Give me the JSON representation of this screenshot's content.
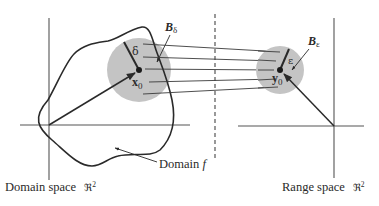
{
  "figure": {
    "colors": {
      "ink": "#2a2a2a",
      "ball_fill": "#c4c4c4",
      "axis": "#555555"
    },
    "domain_panel": {
      "ball_label_main": "B",
      "ball_label_sub": "δ",
      "radius_label": "δ",
      "point_label_main": "x",
      "point_label_sub": "0",
      "region_label_main": "Domain ",
      "region_label_italic": "f",
      "space_label": "Domain space",
      "space_symbol_main": "ℜ",
      "space_symbol_sup": "2"
    },
    "range_panel": {
      "ball_label_main": "B",
      "ball_label_sub": "ε",
      "radius_label": "ε",
      "point_label_main": "y",
      "point_label_sub": "0",
      "space_label": "Range space",
      "space_symbol_main": "ℜ",
      "space_symbol_sup": "2"
    },
    "mapping_lines_count": 5
  }
}
